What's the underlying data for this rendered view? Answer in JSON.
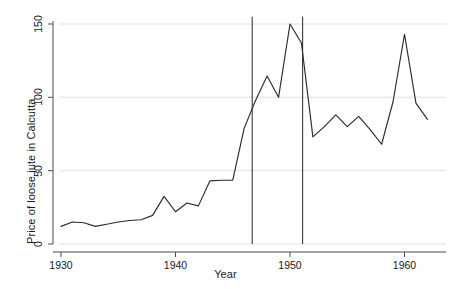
{
  "chart_data": {
    "type": "line",
    "title": "",
    "xlabel": "Year",
    "ylabel": "Price of loose jute in Calcutta",
    "xlim": [
      1929.2,
      1962.6
    ],
    "ylim": [
      0,
      155
    ],
    "xticks": [
      1930,
      1940,
      1950,
      1960
    ],
    "xticklabels": [
      "1930",
      "1940",
      "1950",
      "1960"
    ],
    "yticks": [
      0,
      50,
      100,
      150
    ],
    "yticklabels": [
      "0",
      "50",
      "100",
      "150"
    ],
    "grid": "horizontal-light",
    "legend": "none",
    "x": [
      1930,
      1931,
      1932,
      1933,
      1934,
      1935,
      1936,
      1937,
      1938,
      1939,
      1940,
      1941,
      1942,
      1943,
      1944,
      1945,
      1946,
      1947,
      1948,
      1949,
      1950,
      1951,
      1952,
      1953,
      1954,
      1955,
      1956,
      1957,
      1958,
      1959,
      1960,
      1961,
      1962
    ],
    "values": [
      12,
      15,
      14.5,
      12,
      13.5,
      15,
      16,
      16.5,
      19.5,
      32.5,
      22,
      28,
      26,
      43,
      43.5,
      43.5,
      79,
      98,
      114.5,
      100,
      150,
      137,
      73,
      80,
      88,
      80,
      87,
      78,
      68,
      97,
      143,
      96,
      85
    ],
    "series": [
      {
        "name": "Price of loose jute in Calcutta",
        "color": "#2b2b2b",
        "values": [
          12,
          15,
          14.5,
          12,
          13.5,
          15,
          16,
          16.5,
          19.5,
          32.5,
          22,
          28,
          26,
          43,
          43.5,
          43.5,
          79,
          98,
          114.5,
          100,
          150,
          137,
          73,
          80,
          88,
          80,
          87,
          78,
          68,
          97,
          143,
          96,
          85
        ]
      }
    ],
    "vertical_reference_lines": [
      {
        "x": 1946.7,
        "color": "#3a3a3a"
      },
      {
        "x": 1951.1,
        "color": "#3a3a3a"
      }
    ]
  },
  "axes": {
    "y_title": "Price of loose jute in Calcutta",
    "x_title": "Year",
    "y_tick_0": "0",
    "y_tick_1": "50",
    "y_tick_2": "100",
    "y_tick_3": "150",
    "x_tick_0": "1930",
    "x_tick_1": "1940",
    "x_tick_2": "1950",
    "x_tick_3": "1960"
  },
  "colors": {
    "line": "#2b2b2b",
    "axis": "#4a4a4a",
    "grid": "#ebebeb",
    "text": "#1a1a1a",
    "background": "#ffffff"
  }
}
